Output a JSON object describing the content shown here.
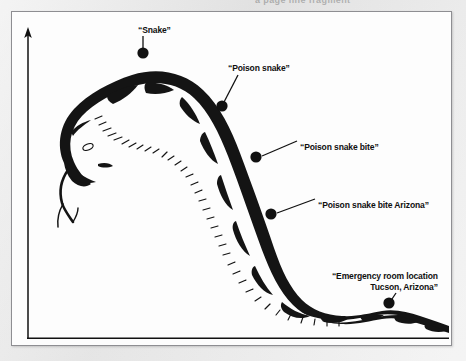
{
  "figure": {
    "artifact_text": "a page line fragment",
    "axes": {
      "y_axis_name": "vertical-axis-arrow",
      "x_axis_name": "horizontal-axis-line"
    },
    "illustration": {
      "name": "rattlesnake-illustration",
      "description": "ink drawing of a rattlesnake curving from upper left down to lower right"
    },
    "callouts": [
      {
        "id": "snake",
        "text": "“Snake”",
        "dot_x": 142,
        "dot_y": 52
      },
      {
        "id": "poison-snake",
        "text": "“Poison snake”",
        "dot_x": 221,
        "dot_y": 105
      },
      {
        "id": "poison-snake-bite",
        "text": "“Poison snake bite”",
        "dot_x": 255,
        "dot_y": 156
      },
      {
        "id": "poison-snake-bite-arizona",
        "text": "“Poison snake bite Arizona”",
        "dot_x": 270,
        "dot_y": 213
      },
      {
        "id": "emergency-room",
        "line1": "“Emergency room location",
        "line2": "Tucson, Arizona”",
        "dot_x": 388,
        "dot_y": 302
      }
    ],
    "colors": {
      "ink": "#101010",
      "page": "#fdfdfd",
      "scan_background": "#e9e9e9",
      "frame_border": "#8e8e92"
    }
  }
}
